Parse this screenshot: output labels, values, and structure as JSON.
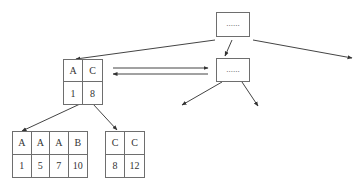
{
  "diagram": {
    "type": "b-tree-index",
    "colors": {
      "stroke": "#6e6e6e",
      "arrow": "#333333",
      "text": "#333333"
    },
    "nodes": {
      "root": {
        "label": "......"
      },
      "internal_right": {
        "label": "......"
      },
      "internal_left": {
        "keys": [
          "A",
          "C"
        ],
        "values": [
          "1",
          "8"
        ]
      },
      "leaf_left": {
        "keys": [
          "A",
          "A",
          "A",
          "B"
        ],
        "values": [
          "1",
          "5",
          "7",
          "10"
        ]
      },
      "leaf_right": {
        "keys": [
          "C",
          "C"
        ],
        "values": [
          "8",
          "12"
        ]
      }
    },
    "edges": [
      {
        "from": "root",
        "to": "internal_left"
      },
      {
        "from": "root",
        "to": "internal_right"
      },
      {
        "from": "root",
        "to": "off-screen-right"
      },
      {
        "from": "internal_left",
        "to": "internal_right",
        "kind": "sibling-link"
      },
      {
        "from": "internal_right",
        "to": "internal_left",
        "kind": "sibling-link"
      },
      {
        "from": "internal_right",
        "to": "child-1"
      },
      {
        "from": "internal_right",
        "to": "child-2"
      },
      {
        "from": "internal_left",
        "to": "leaf_left"
      },
      {
        "from": "internal_left",
        "to": "leaf_right"
      }
    ]
  }
}
